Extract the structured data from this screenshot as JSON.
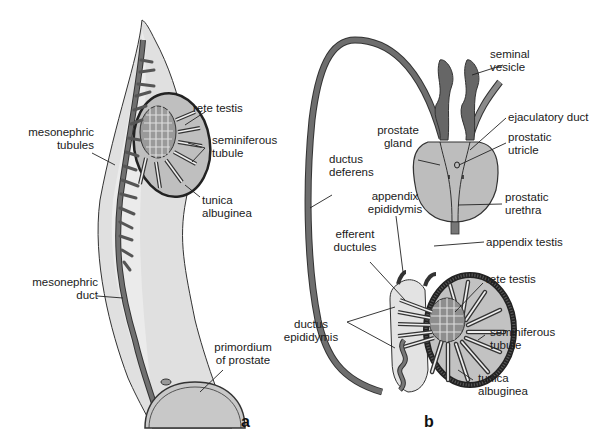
{
  "panel_a": {
    "letter": "a",
    "labels": {
      "rete_testis": "rete testis",
      "mesonephric_tubules_1": "mesonephric",
      "mesonephric_tubules_2": "tubules",
      "seminiferous_tubule_1": "seminiferous",
      "seminiferous_tubule_2": "tubule",
      "tunica_albuginea_1": "tunica",
      "tunica_albuginea_2": "albuginea",
      "mesonephric_duct_1": "mesonephric",
      "mesonephric_duct_2": "duct",
      "primordium_1": "primordium",
      "primordium_2": "of prostate"
    }
  },
  "panel_b": {
    "letter": "b",
    "labels": {
      "seminal_vesicle_1": "seminal",
      "seminal_vesicle_2": "vesicle",
      "ejaculatory_duct": "ejaculatory duct",
      "prostate_gland_1": "prostate",
      "prostate_gland_2": "gland",
      "prostatic_utricle_1": "prostatic",
      "prostatic_utricle_2": "utricle",
      "ductus_deferens_1": "ductus",
      "ductus_deferens_2": "deferens",
      "prostatic_urethra_1": "prostatic",
      "prostatic_urethra_2": "urethra",
      "appendix_epididymis_1": "appendix",
      "appendix_epididymis_2": "epididymis",
      "efferent_ductules_1": "efferent",
      "efferent_ductules_2": "ductules",
      "appendix_testis": "appendix testis",
      "rete_testis": "rete testis",
      "ductus_epididymis_1": "ductus",
      "ductus_epididymis_2": "epididymis",
      "seminiferous_tubule_1": "seminiferous",
      "seminiferous_tubule_2": "tubule",
      "tunica_albuginea_1": "tunica",
      "tunica_albuginea_2": "albuginea"
    }
  },
  "colors": {
    "tissue_light": "#d9d9d9",
    "tissue_mid": "#bdbdbd",
    "duct_dark": "#6e6e6e",
    "outline": "#222222"
  }
}
